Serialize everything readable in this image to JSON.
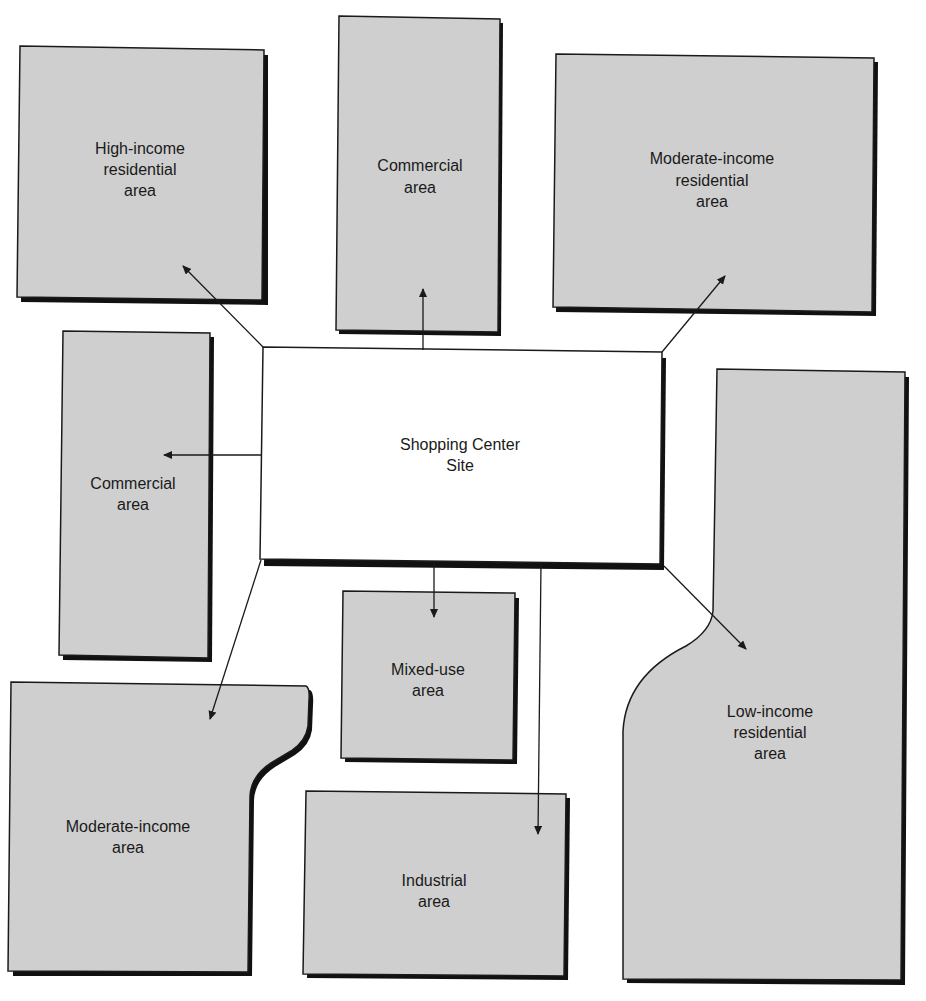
{
  "diagram": {
    "center": {
      "line1": "Shopping Center",
      "line2": "Site"
    },
    "areas": [
      {
        "id": "high-income-residential",
        "lines": [
          "High-income",
          "residential",
          "area"
        ]
      },
      {
        "id": "commercial-top",
        "lines": [
          "Commercial",
          "area"
        ]
      },
      {
        "id": "moderate-income-residential",
        "lines": [
          "Moderate-income",
          "residential",
          "area"
        ]
      },
      {
        "id": "commercial-left",
        "lines": [
          "Commercial",
          "area"
        ]
      },
      {
        "id": "mixed-use",
        "lines": [
          "Mixed-use",
          "area"
        ]
      },
      {
        "id": "moderate-income",
        "lines": [
          "Moderate-income",
          "area"
        ]
      },
      {
        "id": "industrial",
        "lines": [
          "Industrial",
          "area"
        ]
      },
      {
        "id": "low-income-residential",
        "lines": [
          "Low-income",
          "residential",
          "area"
        ]
      }
    ],
    "colors": {
      "area_fill": "#cfcfcf",
      "outline": "#1a1a1a",
      "site_fill": "#ffffff"
    }
  }
}
